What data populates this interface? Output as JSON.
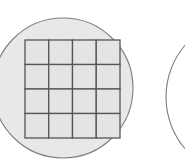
{
  "canvas": {
    "width": 185,
    "height": 161,
    "background_color": "#ffffff"
  },
  "style": {
    "wafer_fill": "#e8e8e8",
    "wafer_stroke": "#7e7e7e",
    "wafer_stroke_width": 1.1,
    "grid_stroke": "#555555",
    "grid_stroke_width": 1.3,
    "die_fill": "#e4e4e4"
  },
  "shapes": {
    "primary_wafer": {
      "label": "wafer-circle",
      "cx": 63,
      "cy": 88,
      "r": 70
    },
    "secondary_wafer": {
      "label": "wafer-circle-partial",
      "cx": 246,
      "cy": 97,
      "r": 80
    },
    "die_grid": {
      "label": "die-grid",
      "x": 25,
      "y": 40,
      "width": 95,
      "height": 98,
      "columns": 4,
      "rows": 4,
      "cells": [
        [
          "r1c1",
          "r1c2",
          "r1c3",
          "r1c4"
        ],
        [
          "r2c1",
          "r2c2",
          "r2c3",
          "r2c4"
        ],
        [
          "r3c1",
          "r3c2",
          "r3c3",
          "r3c4"
        ],
        [
          "r4c1",
          "r4c2",
          "r4c3",
          "r4c4"
        ]
      ]
    }
  }
}
